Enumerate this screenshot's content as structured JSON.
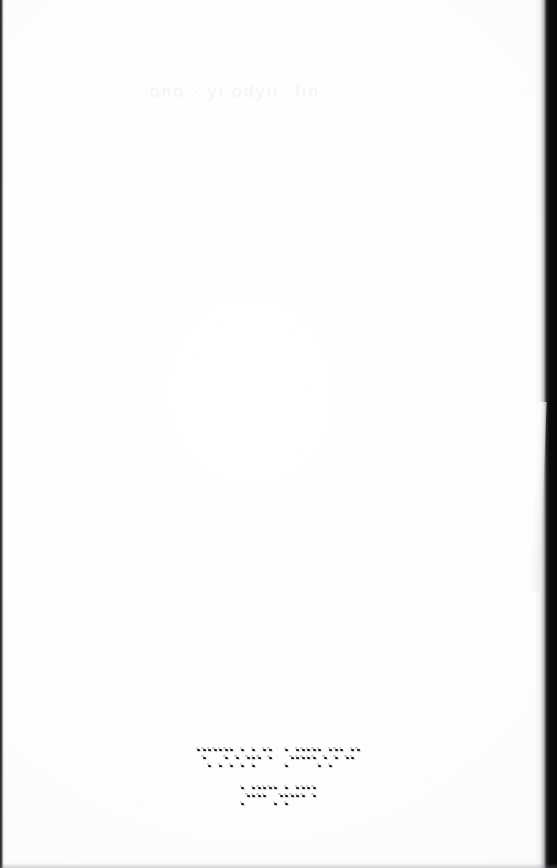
{
  "document": {
    "kind": "scanned-page",
    "media": "embossed braille paper",
    "page_background_color": "#fdfdfd",
    "ink_color": "#141416",
    "edge_shadow_color": "#09090a",
    "ghost_text_color": "#f3f3f4"
  },
  "ghost_text": {
    "visible_fragment": "ono  · yi odyit· fin",
    "note": "extremely faint show-through near top of page"
  },
  "braille": {
    "line_count": 2,
    "alignment": "center",
    "lines": [
      {
        "id": "braille-line-1",
        "words": [
          {
            "cells": [
              [
                1,
                4,
                5
              ],
              [
                1,
                3,
                4
              ],
              [
                1,
                3,
                4,
                5
              ],
              [
                1,
                3,
                5
              ],
              [
                1,
                3,
                5
              ],
              [
                1,
                2,
                3,
                5
              ],
              [
                1,
                4,
                5
              ]
            ]
          },
          {
            "cells": [
              [
                1,
                3,
                5
              ],
              [
                1,
                2,
                4,
                5
              ],
              [
                1,
                2,
                4,
                5
              ],
              [
                1,
                3,
                5
              ],
              [
                1,
                3,
                4,
                5
              ],
              [
                1,
                5
              ],
              [
                1,
                2,
                4
              ]
            ]
          }
        ]
      },
      {
        "id": "braille-line-2",
        "words": [
          {
            "cells": [
              [
                1,
                3,
                5
              ],
              [
                1,
                2,
                4,
                5
              ],
              [
                1,
                2,
                4
              ],
              [
                1,
                3,
                5
              ],
              [
                1,
                2,
                3,
                5
              ],
              [
                1,
                2,
                4,
                5
              ],
              [
                1,
                4,
                5
              ]
            ]
          }
        ]
      }
    ]
  },
  "artifacts": {
    "left_edge": "thin dark scanner gutter line",
    "right_edge": "wide black scanner shadow band",
    "page_curl": "light diagonal highlight at mid-right",
    "speckles": "scattered grey dust specks across field"
  }
}
